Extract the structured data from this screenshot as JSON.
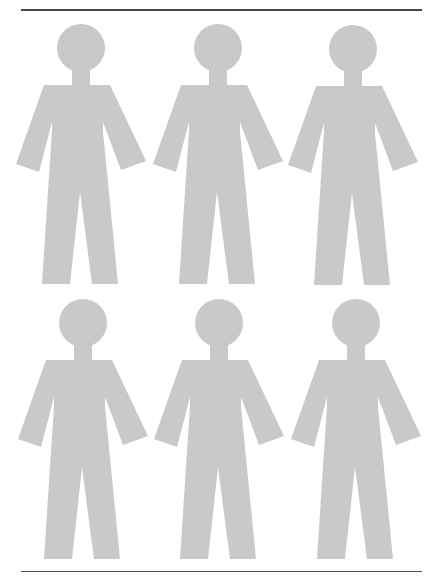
{
  "page": {
    "figure_color": "#c9c9c9",
    "rule_color": "#4a4a4a",
    "background": "#ffffff"
  },
  "grid": {
    "rows": 2,
    "columns": 3,
    "figures": [
      {
        "id": "figure-1",
        "row": 1,
        "col": 1,
        "dx": 0,
        "dy": 0
      },
      {
        "id": "figure-2",
        "row": 1,
        "col": 2,
        "dx": 137,
        "dy": 0
      },
      {
        "id": "figure-3",
        "row": 1,
        "col": 3,
        "dx": 272,
        "dy": 1
      },
      {
        "id": "figure-4",
        "row": 2,
        "col": 1,
        "dx": 2,
        "dy": 275
      },
      {
        "id": "figure-5",
        "row": 2,
        "col": 2,
        "dx": 138,
        "dy": 275
      },
      {
        "id": "figure-6",
        "row": 2,
        "col": 3,
        "dx": 275,
        "dy": 275
      }
    ]
  }
}
